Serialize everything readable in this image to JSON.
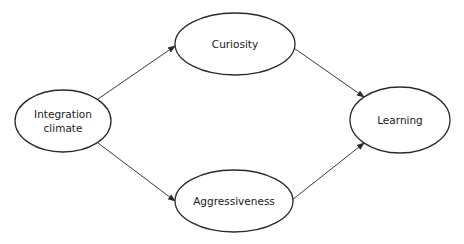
{
  "diagram": {
    "type": "path-model",
    "nodes": [
      {
        "id": "integration_climate",
        "label_lines": [
          "Integration",
          "climate"
        ],
        "cx": 63,
        "cy": 121,
        "rx": 48,
        "ry": 31
      },
      {
        "id": "curiosity",
        "label_lines": [
          "Curiosity"
        ],
        "cx": 235,
        "cy": 44,
        "rx": 60,
        "ry": 31
      },
      {
        "id": "aggressiveness",
        "label_lines": [
          "Aggressiveness"
        ],
        "cx": 234,
        "cy": 201,
        "rx": 59,
        "ry": 31
      },
      {
        "id": "learning",
        "label_lines": [
          "Learning"
        ],
        "cx": 400,
        "cy": 120,
        "rx": 50,
        "ry": 33
      }
    ],
    "edges": [
      {
        "from": "integration_climate",
        "to": "curiosity",
        "x1": 98,
        "y1": 99,
        "x2": 175,
        "y2": 46
      },
      {
        "from": "integration_climate",
        "to": "aggressiveness",
        "x1": 98,
        "y1": 143,
        "x2": 175,
        "y2": 201
      },
      {
        "from": "curiosity",
        "to": "learning",
        "x1": 291,
        "y1": 46,
        "x2": 364,
        "y2": 97
      },
      {
        "from": "aggressiveness",
        "to": "learning",
        "x1": 292,
        "y1": 200,
        "x2": 364,
        "y2": 143
      }
    ],
    "colors": {
      "stroke": "#2a2a2a",
      "edge": "#3a3a3a",
      "background": "#ffffff",
      "label": "#1a1a1a"
    }
  }
}
